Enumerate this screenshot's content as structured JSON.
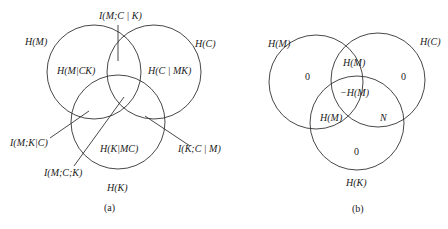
{
  "panel_a": {
    "caption": "(a)",
    "circles": {
      "M": {
        "label": "H(M)",
        "cx": 94,
        "cy": 72,
        "r": 47
      },
      "C": {
        "label": "H(C)",
        "cx": 154,
        "cy": 72,
        "r": 47
      },
      "K": {
        "label": "H(K)",
        "cx": 118,
        "cy": 122,
        "r": 47
      }
    },
    "regions": {
      "m_only": "H(M|CK)",
      "c_only": "H(C | MK)",
      "k_only": "H(K|MC)",
      "mc_given_k": "I(M;C | K)",
      "mk_given_c": "I(M;K|C)",
      "mck": "I(M;C;K)",
      "kc_given_m": "I(K;C | M)"
    }
  },
  "panel_b": {
    "caption": "(b)",
    "circles": {
      "M": {
        "label": "H(M)",
        "cx": 316,
        "cy": 82,
        "r": 47
      },
      "C": {
        "label": "H(C)",
        "cx": 378,
        "cy": 80,
        "r": 47
      },
      "K": {
        "label": "H(K)",
        "cx": 357,
        "cy": 123,
        "r": 47
      }
    },
    "regions": {
      "m_only": "0",
      "c_only": "0",
      "k_only": "0",
      "mc": "H(M)",
      "center": "−H(M)",
      "mk": "H(M)",
      "ck": "N"
    }
  }
}
